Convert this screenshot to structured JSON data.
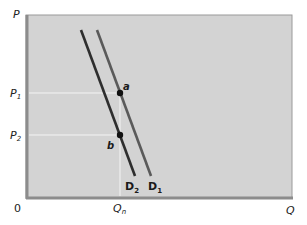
{
  "diagram": {
    "type": "supply-demand",
    "axes": {
      "y_label": "P",
      "x_label": "Q",
      "origin_label": "0"
    },
    "price_levels": [
      {
        "main": "P",
        "sub": "1"
      },
      {
        "main": "P",
        "sub": "2"
      }
    ],
    "quantity_level": {
      "main": "Q",
      "sub": "n"
    },
    "curves": [
      {
        "main": "D",
        "sub": "1",
        "color": "#5a5a5a"
      },
      {
        "main": "D",
        "sub": "2",
        "color": "#2e2e2e"
      }
    ],
    "points": [
      {
        "label": "a",
        "on": "D1",
        "at": "P1, Qn"
      },
      {
        "label": "b",
        "on": "D2",
        "at": "P2, Qn"
      }
    ],
    "colors": {
      "plot_background": "#d3d3d3",
      "frame_dark": "#8c8c8c",
      "guide_lines": "#f4f4f4"
    }
  }
}
